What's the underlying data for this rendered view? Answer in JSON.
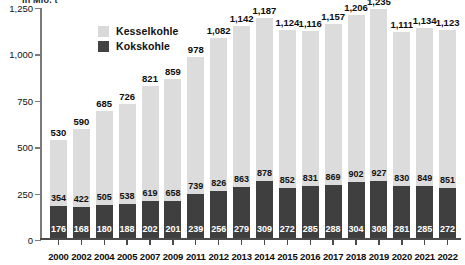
{
  "axis": {
    "unit_caption": "in Mio. t",
    "y_ticks": [
      "0",
      "250",
      "500",
      "750",
      "1,000",
      "1,250"
    ]
  },
  "legend": {
    "items": [
      {
        "label": "Kesselkohle",
        "color": "#d9d9d9",
        "icon": "legend-swatch-icon"
      },
      {
        "label": "Kokskohle",
        "color": "#434343",
        "icon": "legend-swatch-icon"
      }
    ]
  },
  "chart_data": {
    "type": "bar",
    "title": "",
    "subtitle": "",
    "xlabel": "",
    "ylabel": "in Mio. t",
    "ylim": [
      0,
      1250
    ],
    "ytick_values": [
      0,
      250,
      500,
      750,
      1000,
      1250
    ],
    "ytick_labels": [
      "0",
      "250",
      "500",
      "750",
      "1,000",
      "1,250"
    ],
    "grid": false,
    "stacked": true,
    "legend_position": "top-left",
    "categories": [
      "2000",
      "2002",
      "2004",
      "2005",
      "2007",
      "2009",
      "2011",
      "2012",
      "2013",
      "2014",
      "2015",
      "2016",
      "2017",
      "2018",
      "2019",
      "2020",
      "2021",
      "2022"
    ],
    "series": [
      {
        "name": "Kesselkohle",
        "color": "#d9d9d9",
        "values": [
          354,
          422,
          505,
          538,
          619,
          658,
          739,
          826,
          863,
          878,
          852,
          831,
          869,
          902,
          927,
          830,
          849,
          851
        ]
      },
      {
        "name": "Kokskohle",
        "color": "#434343",
        "values": [
          176,
          168,
          180,
          188,
          202,
          201,
          239,
          256,
          279,
          309,
          272,
          285,
          288,
          304,
          308,
          281,
          285,
          272
        ]
      }
    ],
    "totals": [
      530,
      590,
      685,
      726,
      821,
      859,
      978,
      1082,
      1142,
      1187,
      1124,
      1116,
      1157,
      1206,
      1235,
      1111,
      1134,
      1123
    ],
    "total_labels": [
      "530",
      "590",
      "685",
      "726",
      "821",
      "859",
      "978",
      "1,082",
      "1,142",
      "1,187",
      "1,124",
      "1,116",
      "1,157",
      "1,206",
      "1,235",
      "1,111",
      "1,134",
      "1,123"
    ],
    "kessel_labels": [
      "354",
      "422",
      "505",
      "538",
      "619",
      "658",
      "739",
      "826",
      "863",
      "878",
      "852",
      "831",
      "869",
      "902",
      "927",
      "830",
      "849",
      "851"
    ],
    "koks_labels": [
      "176",
      "168",
      "180",
      "188",
      "202",
      "201",
      "239",
      "256",
      "279",
      "309",
      "272",
      "285",
      "288",
      "304",
      "308",
      "281",
      "285",
      "272"
    ]
  }
}
